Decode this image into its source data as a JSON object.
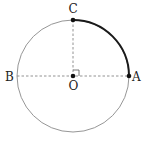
{
  "diagram": {
    "circle": {
      "cx": 73,
      "cy": 76,
      "r": 56,
      "stroke": "#8a8a8a"
    },
    "arc": {
      "from": "C",
      "to": "A",
      "stroke": "#1a1a1a"
    },
    "points": {
      "O": {
        "label": "O",
        "x": 73,
        "y": 76
      },
      "A": {
        "label": "A",
        "x": 129,
        "y": 76
      },
      "B": {
        "label": "B",
        "x": 17,
        "y": 76
      },
      "C": {
        "label": "C",
        "x": 73,
        "y": 20
      }
    },
    "segments": [
      {
        "from": "B",
        "to": "A",
        "style": "dashed"
      },
      {
        "from": "O",
        "to": "C",
        "style": "dashed"
      }
    ],
    "right_angle_marker": {
      "at": "O",
      "between": [
        "OC",
        "OA"
      ]
    }
  }
}
